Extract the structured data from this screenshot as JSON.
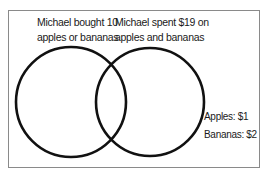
{
  "diagram": {
    "type": "venn",
    "left_set": {
      "label_line1": "Michael bought 10",
      "label_line2": "apples or bananas"
    },
    "right_set": {
      "label_line1": "Michael spent $19 on",
      "label_line2": "apples and bananas"
    },
    "legend": {
      "apples": "Apples: $1",
      "bananas": "Bananas: $2"
    },
    "colors": {
      "stroke": "#111111",
      "frame": "#8a8a8a",
      "background": "#ffffff"
    }
  }
}
